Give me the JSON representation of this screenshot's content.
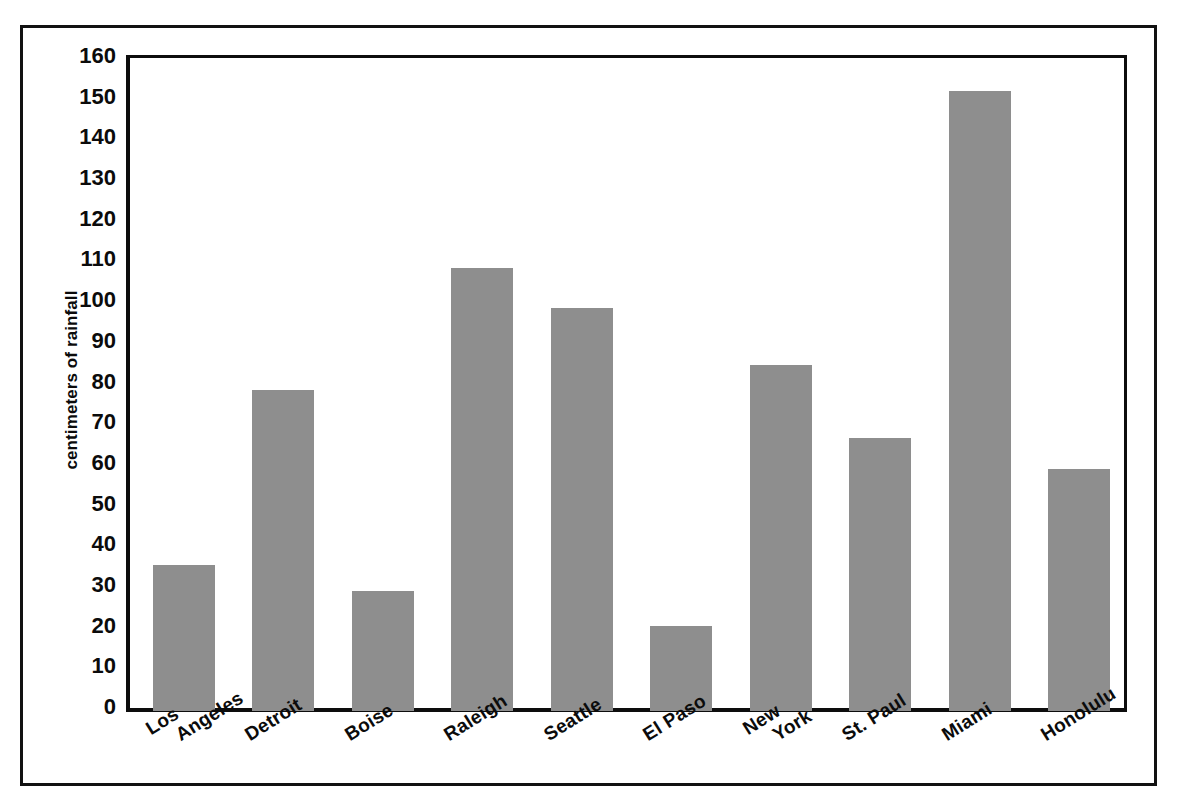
{
  "chart_data": {
    "type": "bar",
    "title": "",
    "subtitle": "",
    "xlabel": "",
    "ylabel": "centimeters of rainfall",
    "ylim": [
      0,
      160
    ],
    "ytick_step": 10,
    "yminor_step": 5,
    "grid": false,
    "legend": "none",
    "bar_color": "#8e8e8e",
    "axis_color": "#0d0d0d",
    "categories": [
      "Los Angeles",
      "Detroit",
      "Boise",
      "Raleigh",
      "Seattle",
      "El Paso",
      "New York",
      "St. Paul",
      "Miami",
      "Honolulu"
    ],
    "category_label_lines": [
      [
        "Los",
        "Angeles"
      ],
      [
        "Detroit"
      ],
      [
        "Boise"
      ],
      [
        "Raleigh"
      ],
      [
        "Seattle"
      ],
      [
        "El Paso"
      ],
      [
        "New",
        "York"
      ],
      [
        "St. Paul"
      ],
      [
        "Miami"
      ],
      [
        "Honolulu"
      ]
    ],
    "values": [
      36,
      79,
      29.5,
      109,
      99,
      21,
      85,
      67,
      152.5,
      59.5
    ],
    "ytick_labels": [
      "0",
      "10",
      "20",
      "30",
      "40",
      "50",
      "60",
      "70",
      "80",
      "90",
      "100",
      "110",
      "120",
      "130",
      "140",
      "150",
      "160"
    ],
    "ytick_values": [
      0,
      10,
      20,
      30,
      40,
      50,
      60,
      70,
      80,
      90,
      100,
      110,
      120,
      130,
      140,
      150,
      160
    ],
    "yminor_values": [
      5,
      15,
      25,
      35,
      45,
      55,
      65,
      75,
      85,
      95,
      105,
      115,
      125,
      135,
      145,
      155
    ]
  },
  "figure": {
    "frame": "double-rule-border",
    "background": "#ffffff"
  }
}
